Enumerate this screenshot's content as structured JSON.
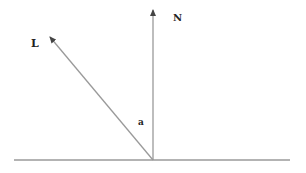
{
  "diagram": {
    "labels": {
      "light": "L",
      "normal": "N",
      "angle": "a"
    },
    "colors": {
      "line": "#9a9a9a",
      "arrowhead": "#444444",
      "text": "#222222"
    }
  }
}
